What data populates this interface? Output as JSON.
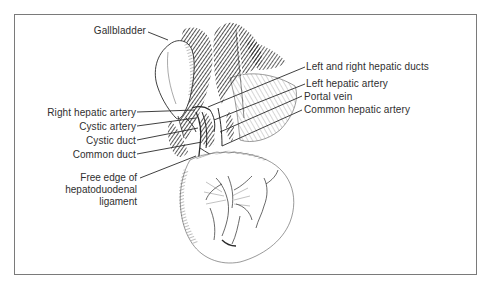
{
  "figure": {
    "border_color": "#7a7a7a",
    "line_color": "#2a2a2a"
  },
  "labels": {
    "gallbladder": "Gallbladder",
    "left_and_right_hepatic_ducts": "Left and right hepatic ducts",
    "left_hepatic_artery": "Left hepatic artery",
    "portal_vein": "Portal vein",
    "common_hepatic_artery": "Common hepatic artery",
    "right_hepatic_artery": "Right hepatic artery",
    "cystic_artery": "Cystic artery",
    "cystic_duct": "Cystic duct",
    "common_duct": "Common duct",
    "free_edge": {
      "line1": "Free edge of",
      "line2": "hepatoduodenal",
      "line3": "ligament"
    }
  }
}
